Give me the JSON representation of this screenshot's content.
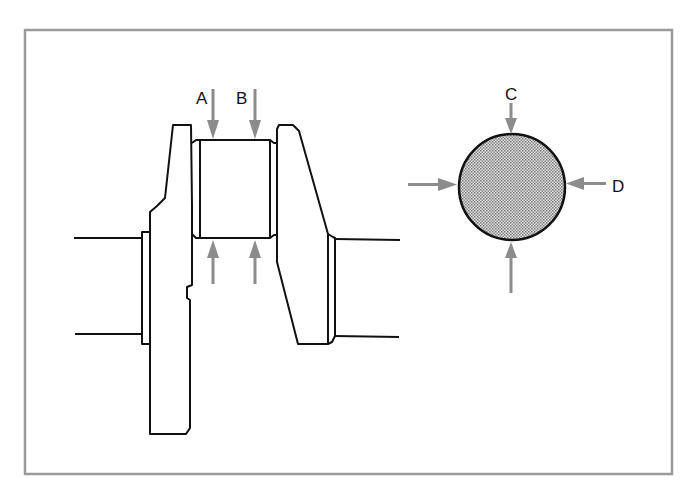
{
  "figure": {
    "labels": {
      "a": "A",
      "b": "B",
      "c": "C",
      "d": "D"
    },
    "colors": {
      "frame": "#9a9a9a",
      "line": "#111111",
      "arrow": "#8c8c8c",
      "shading": "#b8b8b8"
    }
  }
}
